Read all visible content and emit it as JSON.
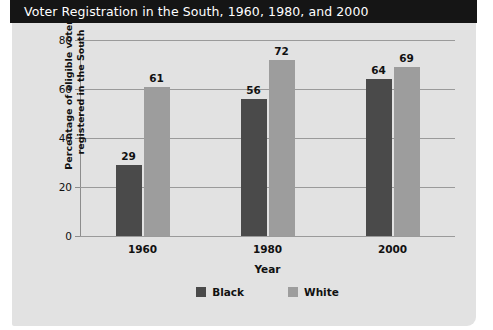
{
  "title": "Voter Registration in the South, 1960, 1980, and 2000",
  "colors": {
    "panel_background": "#e2e2e2",
    "title_bar": "#151515",
    "title_text": "#ffffff",
    "black_series": "#4a4a4a",
    "white_series": "#9d9d9d",
    "gridline": "#9a9a9a"
  },
  "chart_data": {
    "type": "bar",
    "title": "Voter Registration in the South, 1960, 1980, and 2000",
    "xlabel": "Year",
    "ylabel": "Percentage of eligible voters registered in the South",
    "ylabel_lines": [
      "Percentage of eligible voters",
      "registered in the South"
    ],
    "categories": [
      "1960",
      "1980",
      "2000"
    ],
    "series": [
      {
        "name": "Black",
        "color": "#4a4a4a",
        "values": [
          29,
          56,
          64
        ]
      },
      {
        "name": "White",
        "color": "#9d9d9d",
        "values": [
          61,
          72,
          69
        ]
      }
    ],
    "ylim": [
      0,
      80
    ],
    "yticks": [
      0,
      20,
      40,
      60,
      80
    ],
    "ytick_labels": [
      "0",
      "20",
      "40",
      "60",
      "80"
    ],
    "grid": true,
    "grid_axis": "y",
    "legend_position": "bottom",
    "data_labels": true
  }
}
